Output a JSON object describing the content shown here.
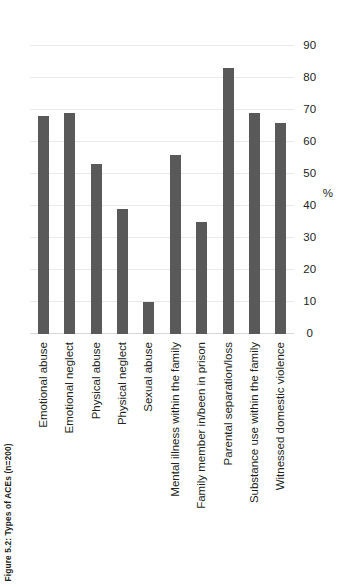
{
  "caption": {
    "full": "Figure 5.2: Types of ACEs (n=200)",
    "label": "Figure 5.2:",
    "text": "Types of ACEs (n=200)"
  },
  "colors": {
    "bar": "#595959",
    "grid": "#e9e9ea",
    "text": "#231f20",
    "background": "#ffffff"
  },
  "chart_data": {
    "type": "bar",
    "orientation": "vertical",
    "title": "Figure 5.2: Types of ACEs (n=200)",
    "xlabel": "",
    "ylabel": "%",
    "ylim": [
      0,
      90
    ],
    "yticks": [
      0,
      10,
      20,
      30,
      40,
      50,
      60,
      70,
      80,
      90
    ],
    "ytick_labels": [
      "0",
      "10",
      "20",
      "30",
      "40",
      "50",
      "60",
      "70",
      "80",
      "90"
    ],
    "grid": true,
    "legend": false,
    "categories": [
      "Emotional abuse",
      "Emotional neglect",
      "Physical abuse",
      "Physical neglect",
      "Sexual abuse",
      "Mental illness within the family",
      "Family member in/been in prison",
      "Parental separation/loss",
      "Substance use within the family",
      "Witnessed domestic violence"
    ],
    "values": [
      68,
      69,
      53,
      39,
      10,
      56,
      35,
      83,
      69,
      66
    ],
    "n": 200
  }
}
